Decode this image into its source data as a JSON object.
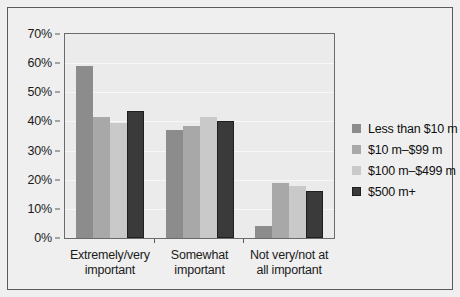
{
  "chart_data": {
    "type": "bar",
    "title": "",
    "xlabel": "",
    "ylabel": "",
    "ylim": [
      0,
      70
    ],
    "ytick_labels": [
      "70%",
      "60%",
      "50%",
      "40%",
      "30%",
      "20%",
      "10%",
      "0%"
    ],
    "ytick_values": [
      70,
      60,
      50,
      40,
      30,
      20,
      10,
      0
    ],
    "grid": true,
    "legend_position": "right",
    "categories": [
      "Extremely/very important",
      "Somewhat important",
      "Not very/not at all important"
    ],
    "category_lines": [
      [
        "Extremely/very",
        "important"
      ],
      [
        "Somewhat",
        "important"
      ],
      [
        "Not very/not at",
        "all important"
      ]
    ],
    "series": [
      {
        "name": "Less than $10 m",
        "color": "#8c8c8c",
        "values": [
          59,
          37,
          4
        ]
      },
      {
        "name": "$10 m–$99 m",
        "color": "#a8a8a8",
        "values": [
          41.5,
          38.5,
          19
        ]
      },
      {
        "name": "$100 m–$499 m",
        "color": "#c9c9c9",
        "values": [
          39.5,
          41.5,
          18
        ]
      },
      {
        "name": "$500 m+",
        "color": "#3a3a3a",
        "values": [
          43.5,
          40,
          16
        ]
      }
    ]
  }
}
